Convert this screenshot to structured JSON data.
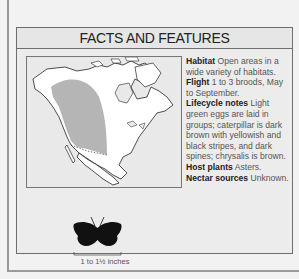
{
  "panel": {
    "title": "FACTS AND FEATURES",
    "facts": [
      {
        "key": "Habitat",
        "value": " Open areas in a wide variety of habitats."
      },
      {
        "key": "Flight",
        "value": " 1 to 3 broods, May to September."
      },
      {
        "key": "Lifecycle notes",
        "value": " Light green eggs are laid in groups; caterpillar is dark brown with yellowish and black stripes, and dark spines; chrysalis is brown."
      },
      {
        "key": "Host plants",
        "value": " Asters."
      },
      {
        "key": "Nectar sources",
        "value": " Unknown."
      }
    ],
    "map": {
      "label": "range-map-north-america",
      "range_color": "#a8a8a8",
      "land_color": "#ffffff"
    },
    "wingspan": "1 to 1½ inches",
    "icons": {
      "butterfly": "butterfly-silhouette-icon"
    }
  }
}
